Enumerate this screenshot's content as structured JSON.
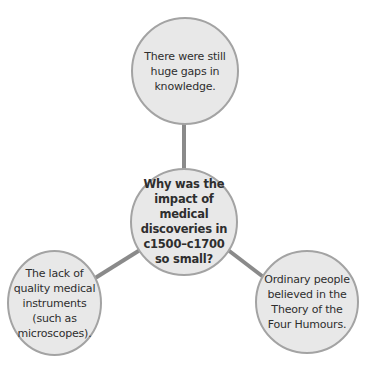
{
  "diagram": {
    "type": "spider-diagram",
    "center": {
      "text": "Why was the impact of medical discoveries in c1500–c1700 so small?"
    },
    "branches": [
      {
        "position": "top",
        "text": "There were still huge gaps in knowledge."
      },
      {
        "position": "bottom-left",
        "text": "The lack of quality medical instruments (such as microscopes)."
      },
      {
        "position": "bottom-right",
        "text": "Ordinary people believed in the Theory of the Four Humours."
      }
    ],
    "colors": {
      "node_fill": "#e8e8e8",
      "node_border": "#a3a3a3",
      "connector": "#8a8a8a",
      "text": "#2e2e2e"
    }
  }
}
